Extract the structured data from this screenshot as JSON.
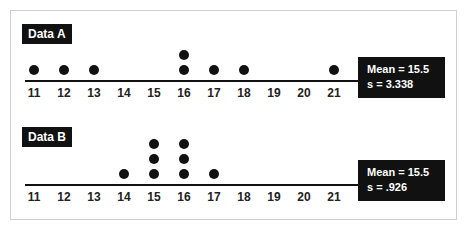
{
  "chart_data": [
    {
      "type": "scatter",
      "subtype": "dot-plot",
      "title": "Data A",
      "x_ticks": [
        11,
        12,
        13,
        14,
        15,
        16,
        17,
        18,
        19,
        20,
        21
      ],
      "xlim": [
        11,
        21
      ],
      "values": [
        11,
        12,
        13,
        16,
        16,
        17,
        18,
        21
      ],
      "counts": {
        "11": 1,
        "12": 1,
        "13": 1,
        "14": 0,
        "15": 0,
        "16": 2,
        "17": 1,
        "18": 1,
        "19": 0,
        "20": 0,
        "21": 1
      },
      "annotation": {
        "mean_label": "Mean = 15.5",
        "sd_label": "s = 3.338",
        "mean": 15.5,
        "s": 3.338
      }
    },
    {
      "type": "scatter",
      "subtype": "dot-plot",
      "title": "Data B",
      "x_ticks": [
        11,
        12,
        13,
        14,
        15,
        16,
        17,
        18,
        19,
        20,
        21
      ],
      "xlim": [
        11,
        21
      ],
      "values": [
        14,
        15,
        15,
        15,
        16,
        16,
        16,
        17
      ],
      "counts": {
        "11": 0,
        "12": 0,
        "13": 0,
        "14": 1,
        "15": 3,
        "16": 3,
        "17": 1,
        "18": 0,
        "19": 0,
        "20": 0,
        "21": 0
      },
      "annotation": {
        "mean_label": "Mean = 15.5",
        "sd_label": "s = .926",
        "mean": 15.5,
        "s": 0.926
      }
    }
  ],
  "panels": {
    "a": {
      "label": "Data A",
      "mean": "Mean = 15.5",
      "s": "s = 3.338"
    },
    "b": {
      "label": "Data B",
      "mean": "Mean = 15.5",
      "s": "s = .926"
    }
  },
  "colors": {
    "ink": "#111111",
    "frame": "#cfcfcf",
    "background": "#ffffff"
  }
}
